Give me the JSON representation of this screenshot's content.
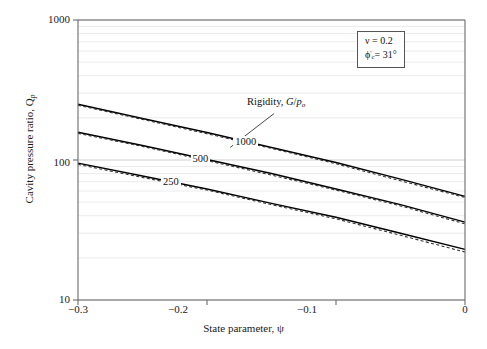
{
  "chart_data": {
    "type": "line",
    "title": "",
    "xlabel": "State parameter, ψ",
    "ylabel": "Cavity pressure ratio, Qₒ",
    "xlim": [
      -0.3,
      0
    ],
    "ylim": [
      10,
      1000
    ],
    "yscale": "log",
    "xscale": "linear",
    "grid": true,
    "grid_style": "horizontal minor log gridlines, light gray",
    "xticks": [
      -0.3,
      -0.2,
      -0.1,
      0
    ],
    "xtick_labels": [
      "−0.3",
      "−0.2",
      "−0.1",
      "0"
    ],
    "yticks": [
      10,
      100,
      1000
    ],
    "ytick_labels": [
      "10",
      "100",
      "1000"
    ],
    "legend_position": "inline curve labels",
    "annotations": [
      {
        "name": "rigidity-callout",
        "text": "Rigidity, G/pₒ",
        "leader_from": [
          -0.2,
          248
        ],
        "leader_to": [
          -0.16,
          160
        ]
      },
      {
        "name": "parameter-box",
        "lines": [
          "ν = 0.2",
          "ϕ'ᶜ = 31°"
        ]
      }
    ],
    "series": [
      {
        "name": "1000",
        "label": "1000",
        "style": "solid",
        "color": "#000000",
        "label_at_x": -0.17,
        "x": [
          -0.3,
          -0.25,
          -0.2,
          -0.15,
          -0.1,
          -0.05,
          0
        ],
        "y": [
          250,
          198,
          157,
          123,
          96,
          73,
          55
        ]
      },
      {
        "name": "1000-dashed",
        "label": "",
        "style": "dashed",
        "color": "#333333",
        "x": [
          -0.3,
          -0.25,
          -0.2,
          -0.15,
          -0.1,
          -0.05,
          0
        ],
        "y": [
          246,
          195,
          154,
          121,
          94,
          71,
          54
        ]
      },
      {
        "name": "500",
        "label": "500",
        "style": "solid",
        "color": "#000000",
        "label_at_x": -0.205,
        "x": [
          -0.3,
          -0.25,
          -0.2,
          -0.15,
          -0.1,
          -0.05,
          0
        ],
        "y": [
          158,
          127,
          101,
          80,
          62,
          48,
          36
        ]
      },
      {
        "name": "500-dashed",
        "label": "",
        "style": "dashed",
        "color": "#333333",
        "x": [
          -0.3,
          -0.25,
          -0.2,
          -0.15,
          -0.1,
          -0.05,
          0
        ],
        "y": [
          155,
          125,
          99,
          78,
          61,
          47,
          35
        ]
      },
      {
        "name": "250",
        "label": "250",
        "style": "solid",
        "color": "#000000",
        "label_at_x": -0.228,
        "x": [
          -0.3,
          -0.25,
          -0.2,
          -0.15,
          -0.1,
          -0.05,
          0
        ],
        "y": [
          95,
          77,
          62,
          49,
          39,
          30,
          23
        ]
      },
      {
        "name": "250-dashed",
        "label": "",
        "style": "dashed",
        "color": "#333333",
        "x": [
          -0.3,
          -0.25,
          -0.2,
          -0.15,
          -0.1,
          -0.05,
          0
        ],
        "y": [
          93,
          75,
          61,
          48,
          38,
          29,
          22
        ]
      }
    ]
  },
  "axes": {
    "xlabel": "State parameter, ψ",
    "ylabel_prefix": "Cavity pressure ratio, Q",
    "ylabel_sub": "p",
    "xtick_labels": [
      "−0.3",
      "−0.2",
      "−0.1",
      "0"
    ],
    "ytick_labels": [
      "1000",
      "100",
      "10"
    ]
  },
  "annotations": {
    "rigidity_prefix": "Rigidity, ",
    "rigidity_symbol_g": "G",
    "rigidity_slash": "/",
    "rigidity_symbol_p": "p",
    "rigidity_sub": "o",
    "param_nu": "ν = 0.2",
    "param_phi_symbol": "ϕ",
    "param_phi_prime": "'",
    "param_phi_sub": "c",
    "param_phi_value": "= 31°"
  },
  "curve_labels": {
    "top": "1000",
    "middle": "500",
    "bottom": "250"
  },
  "colors": {
    "axis": "#6b6b6b",
    "grid": "#d9d9d9",
    "curve_solid": "#000000",
    "curve_dashed": "#3a3a3a",
    "text": "#1a1a1a"
  }
}
